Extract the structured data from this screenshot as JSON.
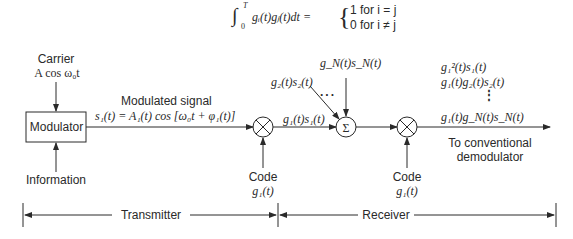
{
  "equation": {
    "integral": "∫",
    "upper": "T",
    "lower": "0",
    "integrand": "gᵢ(t)gⱼ(t)dt =",
    "case1": "1 for i = j",
    "case2": "0 for i ≠ j"
  },
  "transmitter": {
    "carrier_label": "Carrier",
    "carrier_expr": "A cos ω₀t",
    "modulator_label": "Modulator",
    "information_label": "Information",
    "modulated_label": "Modulated signal",
    "modulated_expr": "s₁(t) = A₁(t) cos [ω₀t + φ₁(t)]",
    "code_label": "Code",
    "code_expr": "g₁(t)",
    "mixer_output": "g₁(t)s₁(t)"
  },
  "channel": {
    "input2": "g₂(t)s₂(t)",
    "inputN": "g_N(t)s_N(t)",
    "ellipsis": "· · ·",
    "summer_symbol": "Σ"
  },
  "receiver": {
    "code_label": "Code",
    "code_expr": "g₁(t)",
    "output_terms": [
      "g₁²(t)s₁(t)",
      "g₁(t)g₂(t)s₂(t)",
      "⋮",
      "g₁(t)g_N(t)s_N(t)"
    ],
    "output_label_line1": "To conventional",
    "output_label_line2": "demodulator"
  },
  "sections": {
    "transmitter": "Transmitter",
    "receiver": "Receiver"
  }
}
